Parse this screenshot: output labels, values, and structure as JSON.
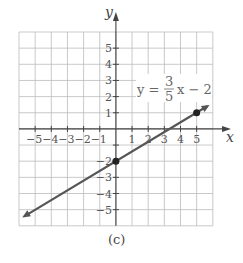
{
  "chart_data": {
    "type": "line",
    "title": "",
    "caption": "(c)",
    "xlabel": "x",
    "ylabel": "y",
    "xlim": [
      -6,
      6
    ],
    "ylim": [
      -6,
      6
    ],
    "grid": true,
    "x_ticks": [
      "-5",
      "-4",
      "-3",
      "-2",
      "-1",
      "1",
      "2",
      "3",
      "4",
      "5"
    ],
    "y_ticks": [
      "5",
      "4",
      "3",
      "2",
      "1",
      "-1",
      "-2",
      "-3",
      "-4",
      "-5"
    ],
    "equation": {
      "lhs": "y =",
      "num": "3",
      "den": "5",
      "rhs": "x − 2"
    },
    "series": [
      {
        "name": "y = 3/5 x − 2",
        "slope": 0.6,
        "intercept": -2,
        "x": [
          -6,
          6
        ],
        "y": [
          -5.6,
          1.6
        ]
      }
    ],
    "points": [
      {
        "x": 0,
        "y": -2
      },
      {
        "x": 5,
        "y": 1
      }
    ],
    "colors": {
      "line": "#555555",
      "grid": "#bbbbbb",
      "axis": "#444444"
    }
  }
}
